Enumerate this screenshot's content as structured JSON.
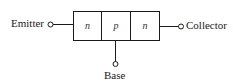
{
  "diagram": {
    "type": "npn-transistor-block",
    "terminals": {
      "emitter": "Emitter",
      "collector": "Collector",
      "base": "Base"
    },
    "regions": [
      "n",
      "p",
      "n"
    ],
    "colors": {
      "stroke": "#1a1a1a",
      "background": "#ffffff"
    }
  }
}
